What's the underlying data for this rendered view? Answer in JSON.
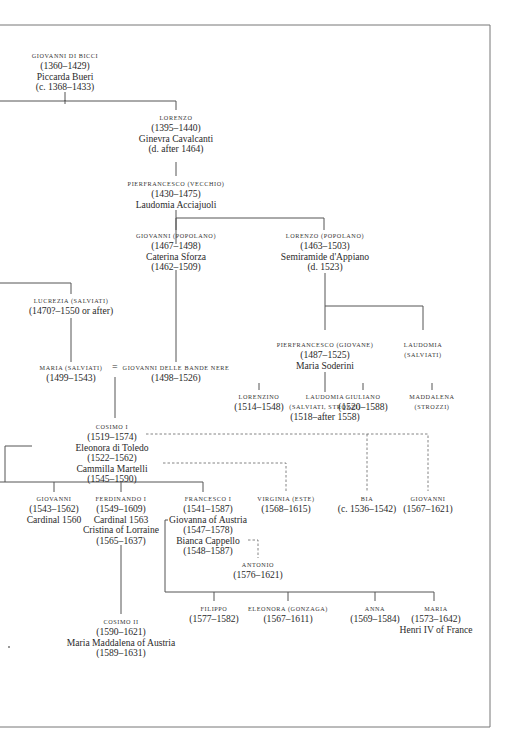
{
  "diagram": {
    "type": "family-tree",
    "nodes": {
      "giovanni_di_bicci": {
        "name": "Giovanni di Bicci",
        "lines": [
          "(1360–1429)",
          "Piccarda Bueri",
          "(c. 1368–1433)"
        ]
      },
      "lorenzo": {
        "name": "Lorenzo",
        "lines": [
          "(1395–1440)",
          "Ginevra Cavalcanti",
          "(d. after 1464)"
        ]
      },
      "pierfrancesco_vecchio": {
        "name": "Pierfrancesco (Vecchio)",
        "lines": [
          "(1430–1475)",
          "Laudomia Acciajuoli"
        ]
      },
      "giovanni_popolano": {
        "name": "Giovanni (Popolano)",
        "lines": [
          "(1467–1498)",
          "Caterina Sforza",
          "(1462–1509)"
        ]
      },
      "lorenzo_popolano": {
        "name": "Lorenzo (Popolano)",
        "lines": [
          "(1463–1503)",
          "Semiramide d'Appiano",
          "(d. 1523)"
        ]
      },
      "lucrezia_salviati": {
        "name": "Lucrezia (Salviati)",
        "lines": [
          "(1470?–1550 or after)"
        ]
      },
      "maria_salviati": {
        "name": "Maria (Salviati)",
        "lines": [
          "(1499–1543)"
        ]
      },
      "marriage_sign": "=",
      "giovanni_bande_nere": {
        "name": "Giovanni delle Bande Nere",
        "lines": [
          "(1498–1526)"
        ]
      },
      "pierfrancesco_giovane": {
        "name": "Pierfrancesco (Giovane)",
        "lines": [
          "(1487–1525)",
          "Maria Soderini"
        ]
      },
      "laudomia_salviati": {
        "name": "Laudomia",
        "lines": [
          "(Salviati)"
        ]
      },
      "lorenzino": {
        "name": "Lorenzino",
        "lines": [
          "(1514–1548)"
        ]
      },
      "laudomia_salviati_strozzi": {
        "name": "Laudomia",
        "lines": [
          "(Salviati, Strozzi)",
          "(1518–after 1558)"
        ]
      },
      "giuliano": {
        "name": "Giuliano",
        "lines": [
          "(1520–1588)"
        ]
      },
      "maddalena_strozzi": {
        "name": "Maddalena",
        "lines": [
          "(Strozzi)"
        ]
      },
      "cosimo_i": {
        "name": "Cosimo I",
        "lines": [
          "(1519–1574)",
          "Eleonora di Toledo",
          "(1522–1562)",
          "Cammilla Martelli",
          "(1545–1590)"
        ]
      },
      "giovanni_cardinal": {
        "name": "Giovanni",
        "lines": [
          "(1543–1562)",
          "Cardinal 1560"
        ]
      },
      "ferdinando_i": {
        "name": "Ferdinando I",
        "lines": [
          "(1549–1609)",
          "Cardinal 1563",
          "Cristina of Lorraine",
          "(1565–1637)"
        ]
      },
      "francesco_i": {
        "name": "Francesco I",
        "lines": [
          "(1541–1587)",
          "Giovanna of Austria",
          "(1547–1578)",
          "Bianca Cappello",
          "(1548–1587)"
        ]
      },
      "virginia_este": {
        "name": "Virginia (Este)",
        "lines": [
          "(1568–1615)"
        ]
      },
      "bia": {
        "name": "Bia",
        "lines": [
          "(c. 1536–1542)"
        ]
      },
      "giovanni_illegit": {
        "name": "Giovanni",
        "lines": [
          "(1567–1621)"
        ]
      },
      "antonio": {
        "name": "Antonio",
        "lines": [
          "(1576–1621)"
        ]
      },
      "filippo": {
        "name": "Filippo",
        "lines": [
          "(1577–1582)"
        ]
      },
      "eleonora_gonzaga": {
        "name": "Eleonora (Gonzaga)",
        "lines": [
          "(1567–1611)"
        ]
      },
      "anna": {
        "name": "Anna",
        "lines": [
          "(1569–1584)"
        ]
      },
      "maria_france": {
        "name": "Maria",
        "lines": [
          "(1573–1642)",
          "Henri IV of France"
        ]
      },
      "cosimo_ii": {
        "name": "Cosimo II",
        "lines": [
          "(1590–1621)",
          "Maria Maddalena of Austria",
          "(1589–1631)"
        ]
      }
    }
  }
}
